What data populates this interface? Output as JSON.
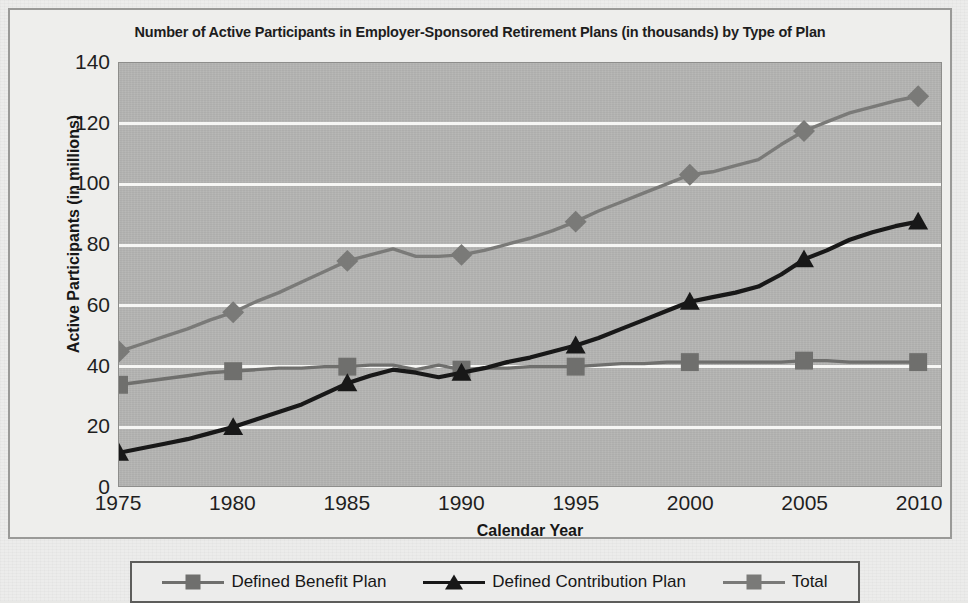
{
  "chart_data": {
    "type": "line",
    "title": "Number of Active Participants in Employer-Sponsored Retirement Plans (in thousands) by Type of Plan",
    "xlabel": "Calendar Year",
    "ylabel": "Active Participants (in millions)",
    "xlim": [
      1975,
      2011
    ],
    "ylim": [
      0,
      140
    ],
    "ytick_step": 20,
    "grid": true,
    "legend_position": "bottom",
    "xticks": [
      "1975",
      "1980",
      "1985",
      "1990",
      "1995",
      "2000",
      "2005",
      "2010"
    ],
    "yticks": [
      "0",
      "20",
      "40",
      "60",
      "80",
      "100",
      "120",
      "140"
    ],
    "x": [
      1975,
      1976,
      1977,
      1978,
      1979,
      1980,
      1981,
      1982,
      1983,
      1984,
      1985,
      1986,
      1987,
      1988,
      1989,
      1990,
      1991,
      1992,
      1993,
      1994,
      1995,
      1996,
      1997,
      1998,
      1999,
      2000,
      2001,
      2002,
      2003,
      2004,
      2005,
      2006,
      2007,
      2008,
      2009,
      2010
    ],
    "series": [
      {
        "name": "Defined Benefit Plan",
        "marker": "square",
        "color": "#6f6f6d",
        "marker_years": [
          1975,
          1980,
          1985,
          1990,
          1995,
          2000,
          2005,
          2010
        ],
        "marker_values": [
          33.5,
          38,
          39.5,
          38.5,
          39.5,
          41,
          41.5,
          41
        ],
        "values": [
          33.5,
          34.5,
          35.5,
          36.5,
          37.5,
          38,
          38.5,
          39,
          39,
          39.5,
          39.5,
          40,
          40,
          38.5,
          40,
          38.5,
          39,
          39,
          39.5,
          39.5,
          39.5,
          40,
          40.5,
          40.5,
          41,
          41,
          41,
          41,
          41,
          41,
          41.5,
          41.5,
          41,
          41,
          41,
          41
        ]
      },
      {
        "name": "Defined Contribution Plan",
        "marker": "triangle",
        "color": "#181818",
        "marker_years": [
          1975,
          1980,
          1985,
          1990,
          1995,
          2000,
          2005,
          2010
        ],
        "marker_values": [
          11,
          19.5,
          34,
          37.5,
          46.5,
          61,
          75,
          87.5
        ],
        "values": [
          11,
          12.5,
          14,
          15.5,
          17.5,
          19.5,
          22,
          24.5,
          27,
          30.5,
          34,
          36.5,
          38.5,
          37.5,
          36,
          37.5,
          39,
          41,
          42.5,
          44.5,
          46.5,
          49,
          52,
          55,
          58,
          61,
          62.5,
          64,
          66,
          70,
          75,
          78,
          81.5,
          84,
          86,
          87.5
        ]
      },
      {
        "name": "Total",
        "marker": "diamond",
        "color": "#7a7a78",
        "marker_years": [
          1975,
          1980,
          1985,
          1990,
          1995,
          2000,
          2005,
          2010
        ],
        "marker_values": [
          44.5,
          57.5,
          74.5,
          76.5,
          87.5,
          103,
          117.5,
          129
        ],
        "values": [
          44.5,
          47,
          49.5,
          52,
          55,
          57.5,
          61,
          64,
          67.5,
          71,
          74.5,
          76.5,
          78.5,
          76,
          76,
          76.5,
          78,
          80,
          82,
          84.5,
          87.5,
          91,
          94,
          97,
          100,
          103,
          104,
          106,
          108,
          113,
          117.5,
          120.5,
          123.5,
          125.5,
          127.5,
          129
        ]
      }
    ]
  },
  "legend": {
    "items": [
      {
        "label": "Defined Benefit Plan",
        "marker": "square",
        "color": "#6f6f6d"
      },
      {
        "label": "Defined Contribution Plan",
        "marker": "triangle",
        "color": "#181818"
      },
      {
        "label": "Total",
        "marker": "diamond",
        "color": "#7a7a78"
      }
    ]
  }
}
